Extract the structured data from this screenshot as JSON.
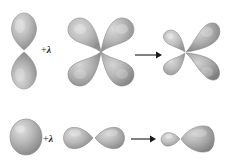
{
  "figure": {
    "type": "chemistry-orbital-hybridization-diagram",
    "background_color": "#ffffff",
    "orbital_fill_light": "#d8d8d8",
    "orbital_fill_mid": "#b0b0b0",
    "orbital_fill_dark": "#8a8a8a",
    "orbital_stroke": "#8f8f8f",
    "arrow_color": "#1a1a1a",
    "text_color": "#2a2a2a"
  },
  "rows": [
    {
      "id": "row-1",
      "label": "d-orbital hybridization",
      "operator_plus": "+",
      "operator_lambda": "λ",
      "arrow": "→",
      "terms": [
        {
          "name": "p-orbital-vertical",
          "shape": "two-lobe-vertical",
          "lobes": 2,
          "orientation": "vertical"
        },
        {
          "name": "d-orbital-four-lobe",
          "shape": "four-lobe-cloverleaf",
          "lobes": 4,
          "orientation": "diagonal"
        },
        {
          "name": "hybrid-orbital-four-lobe-asymmetric",
          "shape": "four-lobe-asymmetric",
          "lobes": 4,
          "orientation": "diagonal"
        }
      ]
    },
    {
      "id": "row-2",
      "label": "sp-orbital hybridization",
      "operator_plus": "+",
      "operator_lambda": "λ",
      "arrow": "→",
      "terms": [
        {
          "name": "s-orbital-sphere",
          "shape": "sphere",
          "lobes": 1,
          "orientation": "none"
        },
        {
          "name": "p-orbital-horizontal",
          "shape": "two-lobe-horizontal",
          "lobes": 2,
          "orientation": "horizontal"
        },
        {
          "name": "hybrid-orbital-two-lobe-asymmetric",
          "shape": "two-lobe-asymmetric",
          "lobes": 2,
          "orientation": "horizontal"
        }
      ]
    }
  ]
}
